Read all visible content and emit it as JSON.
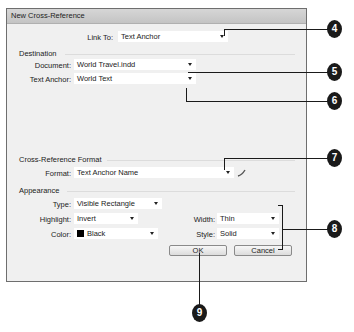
{
  "dialog": {
    "title": "New Cross-Reference",
    "link_to": {
      "label": "Link To:",
      "value": "Text Anchor"
    },
    "destination": {
      "group_label": "Destination",
      "document": {
        "label": "Document:",
        "value": "World Travel.indd"
      },
      "text_anchor": {
        "label": "Text Anchor:",
        "value": "World Text"
      }
    },
    "format_section": {
      "group_label": "Cross-Reference Format",
      "format": {
        "label": "Format:",
        "value": "Text Anchor Name"
      },
      "edit_icon": "pencil-icon"
    },
    "appearance": {
      "group_label": "Appearance",
      "type": {
        "label": "Type:",
        "value": "Visible Rectangle"
      },
      "highlight": {
        "label": "Highlight:",
        "value": "Invert"
      },
      "color": {
        "label": "Color:",
        "value": "Black",
        "swatch": "#000000"
      },
      "width": {
        "label": "Width:",
        "value": "Thin"
      },
      "style": {
        "label": "Style:",
        "value": "Solid"
      }
    },
    "buttons": {
      "ok": "OK",
      "cancel": "Cancel"
    }
  },
  "callouts": [
    "4",
    "5",
    "6",
    "7",
    "8",
    "9"
  ]
}
